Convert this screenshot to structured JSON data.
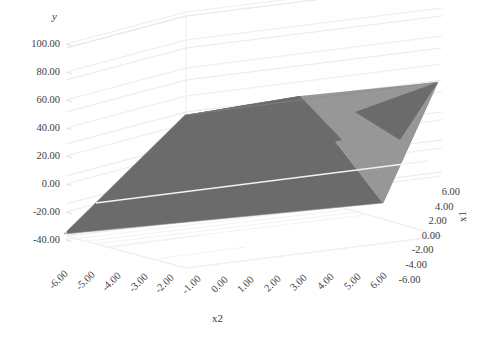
{
  "chart_data": {
    "type": "surface",
    "title": "",
    "xlabel": "x2",
    "ylabel": "y",
    "zlabel": "x1",
    "grid": true,
    "legend": "none",
    "axes": {
      "y": {
        "label": "y",
        "ticks": [
          "100.00",
          "80.00",
          "60.00",
          "40.00",
          "20.00",
          "0.00",
          "-20.00",
          "-40.00"
        ],
        "values": [
          100,
          80,
          60,
          40,
          20,
          0,
          -20,
          -40
        ],
        "min": -40,
        "max": 100,
        "step": 20
      },
      "x2": {
        "label": "x2",
        "ticks": [
          "-6.00",
          "-5.00",
          "-4.00",
          "-3.00",
          "-2.00",
          "-1.00",
          "0.00",
          "1.00",
          "2.00",
          "3.00",
          "4.00",
          "5.00",
          "6.00"
        ],
        "values": [
          -6,
          -5,
          -4,
          -3,
          -2,
          -1,
          0,
          1,
          2,
          3,
          4,
          5,
          6
        ],
        "min": -6,
        "max": 6,
        "step": 1
      },
      "x1": {
        "label": "x1",
        "ticks": [
          "6.00",
          "4.00",
          "2.00",
          "0.00",
          "-2.00",
          "-4.00",
          "-6.00"
        ],
        "values": [
          6,
          4,
          2,
          0,
          -2,
          -4,
          -6
        ],
        "min": -6,
        "max": 6,
        "step": 2
      }
    },
    "series": [
      {
        "name": "y",
        "kind": "plane",
        "description": "Planar surface spanning x1 in [-6,6] and x2 in [-6,6], y ranging from about -35 at (x1=-6, x2=-6) to about 80 at (x1=6, x2=6).",
        "corner_values": [
          {
            "x1": -6,
            "x2": -6,
            "y": -35
          },
          {
            "x1": -6,
            "x2": 6,
            "y": 25
          },
          {
            "x1": 6,
            "x2": -6,
            "y": 20
          },
          {
            "x1": 6,
            "x2": 6,
            "y": 80
          }
        ],
        "bands": [
          {
            "name": "band-dark",
            "color": "#6b6b6b",
            "range": "-35 to 40"
          },
          {
            "name": "band-light",
            "color": "#979797",
            "range": "40 to 80"
          }
        ]
      }
    ],
    "colors": {
      "surface_dark": "#6b6b6b",
      "surface_light": "#979797",
      "grid": "#e8e8e8",
      "wall": "#ffffff",
      "text": "#3d3d3d",
      "background": "#ffffff"
    }
  }
}
